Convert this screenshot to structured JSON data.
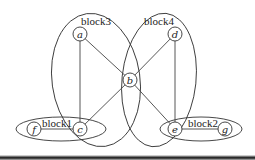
{
  "diagram": {
    "title": "",
    "blocks": [
      {
        "id": "block1",
        "label": "block1"
      },
      {
        "id": "block2",
        "label": "block2"
      },
      {
        "id": "block3",
        "label": "block3"
      },
      {
        "id": "block4",
        "label": "block4"
      }
    ],
    "nodes": [
      {
        "id": "a",
        "label": "a"
      },
      {
        "id": "b",
        "label": "b"
      },
      {
        "id": "c",
        "label": "c"
      },
      {
        "id": "d",
        "label": "d"
      },
      {
        "id": "e",
        "label": "e"
      },
      {
        "id": "f",
        "label": "f"
      },
      {
        "id": "g",
        "label": "g"
      }
    ],
    "edges": [
      {
        "from": "a",
        "to": "c"
      },
      {
        "from": "a",
        "to": "b"
      },
      {
        "from": "b",
        "to": "c"
      },
      {
        "from": "b",
        "to": "d"
      },
      {
        "from": "b",
        "to": "e"
      },
      {
        "from": "d",
        "to": "e"
      },
      {
        "from": "f",
        "to": "c"
      },
      {
        "from": "e",
        "to": "g"
      }
    ],
    "block_membership": {
      "block1": [
        "f",
        "c"
      ],
      "block2": [
        "e",
        "g"
      ],
      "block3": [
        "a",
        "b",
        "c"
      ],
      "block4": [
        "b",
        "d",
        "e"
      ]
    }
  }
}
